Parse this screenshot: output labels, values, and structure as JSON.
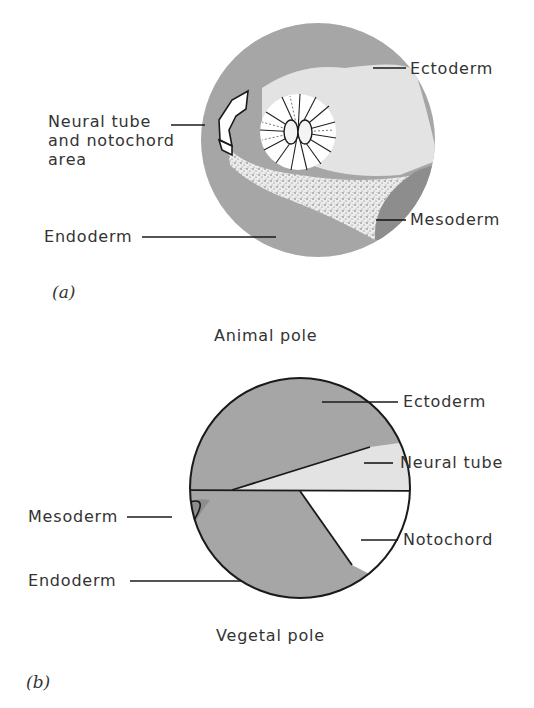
{
  "figure_a": {
    "tag": "(a)",
    "labels": {
      "ectoderm": "Ectoderm",
      "neural_tube_line1": "Neural tube",
      "neural_tube_line2": "and notochord",
      "neural_tube_line3": "area",
      "endoderm": "Endoderm",
      "mesoderm": "Mesoderm"
    }
  },
  "figure_b": {
    "tag": "(b)",
    "top_caption": "Animal pole",
    "bottom_caption": "Vegetal pole",
    "labels": {
      "ectoderm": "Ectoderm",
      "neural_tube": "Neural tube",
      "mesoderm": "Mesoderm",
      "notochord": "Notochord",
      "endoderm": "Endoderm"
    }
  },
  "colors": {
    "ectoderm": "#a6a6a6",
    "neural_plate": "#e3e3e3",
    "mesoderm_dark": "#8d8d8d",
    "endoderm": "#a6a6a6",
    "notochord": "#ffffff",
    "outline": "#1a1a1a"
  }
}
